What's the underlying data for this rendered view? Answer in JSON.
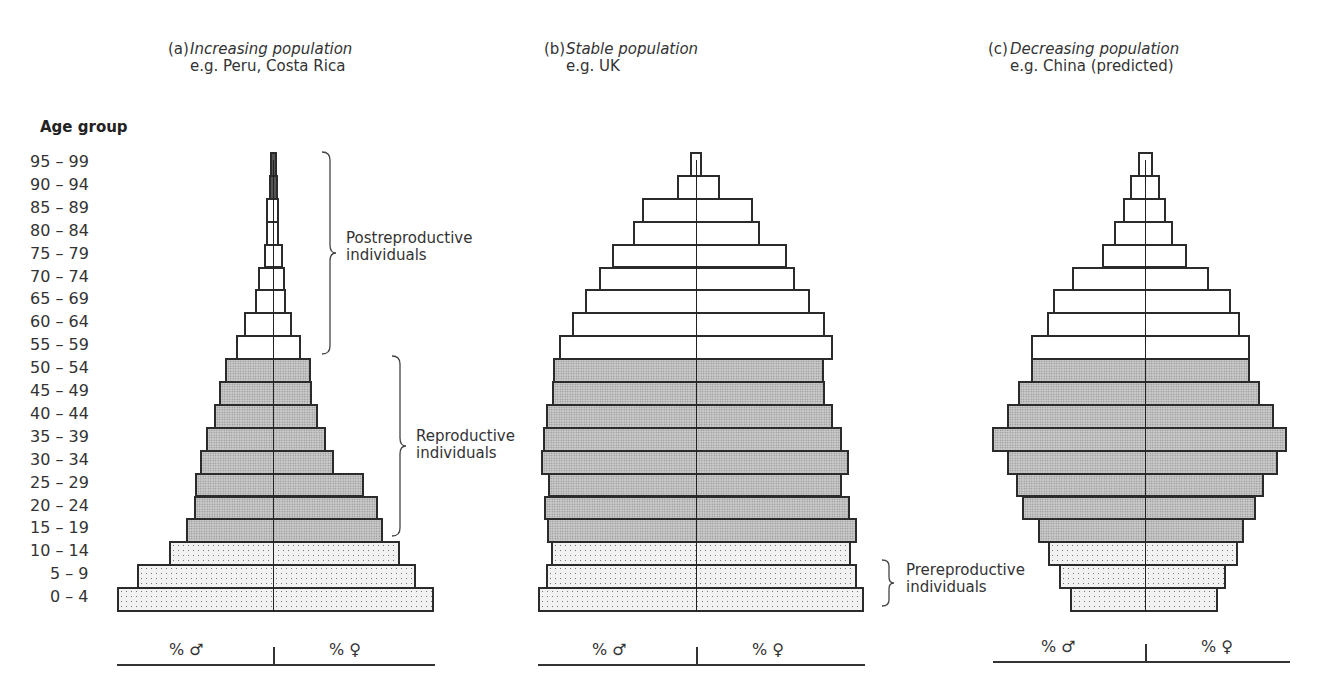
{
  "chart_data": {
    "type": "bar",
    "subtype": "population_pyramid",
    "y_axis_title": "Age group",
    "categories": [
      "95 – 99",
      "90 – 94",
      "85 – 89",
      "80 – 84",
      "75 – 79",
      "70 – 74",
      "65 – 69",
      "60 – 64",
      "55 – 59",
      "50 – 54",
      "45 – 49",
      "40 – 44",
      "35 – 39",
      "30 – 34",
      "25 – 29",
      "20 – 24",
      "15 – 19",
      "10 – 14",
      "5 – 9",
      "0 – 4"
    ],
    "x_axis_labels": {
      "male": "% ♂",
      "female": "% ♀"
    },
    "groups": [
      {
        "range": "95–55",
        "label": "Postreproductive individuals",
        "style": "white"
      },
      {
        "range": "50–15",
        "label": "Reproductive individuals",
        "style": "dense-stipple"
      },
      {
        "range": "10–0",
        "label": "Prereproductive individuals",
        "style": "light-stipple"
      }
    ],
    "panels": [
      {
        "id": "a",
        "tag": "(a)",
        "title": "Increasing population",
        "example": "e.g. Peru, Costa Rica",
        "center_x": 273,
        "male_extent_px": [
          3,
          4,
          7,
          7,
          9,
          15,
          18,
          29,
          37,
          48,
          54,
          59,
          67,
          73,
          78,
          79,
          87,
          104,
          136,
          156
        ],
        "female_extent_px": [
          4,
          5,
          6,
          6,
          10,
          12,
          13,
          19,
          28,
          38,
          39,
          45,
          53,
          61,
          91,
          105,
          110,
          127,
          143,
          161
        ]
      },
      {
        "id": "b",
        "tag": "(b)",
        "title": "Stable population",
        "example": "e.g. UK",
        "center_x": 696,
        "male_extent_px": [
          6,
          19,
          54,
          63,
          84,
          97,
          111,
          124,
          137,
          143,
          144,
          150,
          153,
          155,
          148,
          152,
          149,
          145,
          150,
          158
        ],
        "female_extent_px": [
          6,
          24,
          57,
          64,
          91,
          99,
          114,
          129,
          137,
          128,
          129,
          137,
          146,
          153,
          146,
          154,
          161,
          155,
          161,
          168
        ]
      },
      {
        "id": "c",
        "tag": "(c)",
        "title": "Decreasing population",
        "example": "e.g. China (predicted)",
        "center_x": 1145,
        "male_extent_px": [
          7,
          15,
          22,
          31,
          43,
          73,
          92,
          98,
          114,
          114,
          127,
          138,
          153,
          138,
          129,
          123,
          107,
          97,
          86,
          75
        ],
        "female_extent_px": [
          8,
          15,
          21,
          28,
          42,
          64,
          86,
          95,
          105,
          105,
          115,
          129,
          142,
          133,
          119,
          111,
          99,
          93,
          81,
          73
        ]
      }
    ]
  },
  "annotations": {
    "postreproductive": [
      "Postreproductive",
      "individuals"
    ],
    "reproductive": [
      "Reproductive",
      "individuals"
    ],
    "prereproductive": [
      "Prereproductive",
      "individuals"
    ]
  }
}
